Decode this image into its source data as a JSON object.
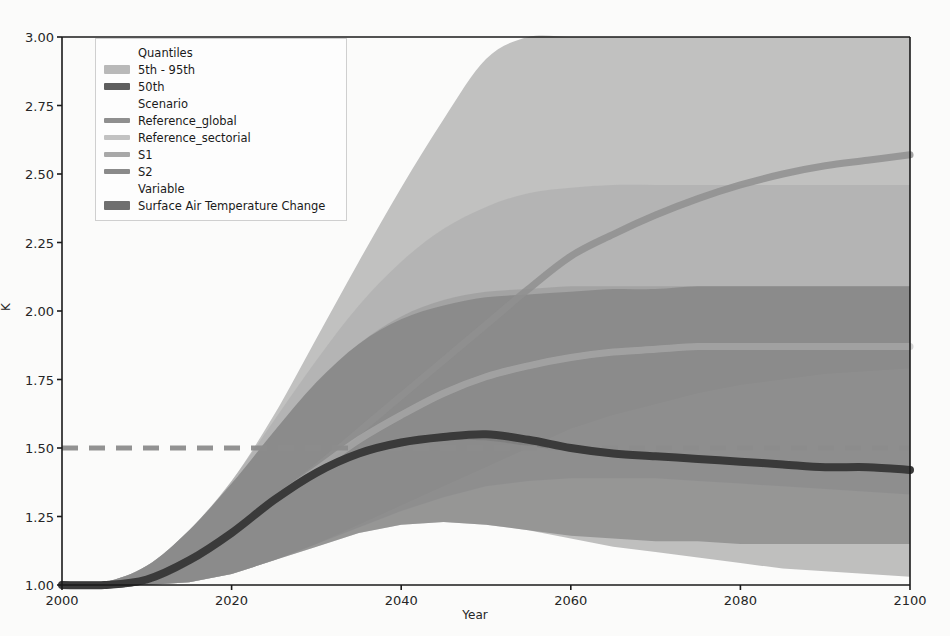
{
  "chart_data": {
    "type": "area",
    "title": "",
    "xlabel": "Year",
    "ylabel": "K",
    "xlim": [
      2000,
      2100
    ],
    "ylim": [
      1.0,
      3.0
    ],
    "xticks": [
      2000,
      2020,
      2040,
      2060,
      2080,
      2100
    ],
    "yticks": [
      "1.00",
      "1.25",
      "1.50",
      "1.75",
      "2.00",
      "2.25",
      "2.50",
      "2.75",
      "3.00"
    ],
    "grid": false,
    "legend_position": "upper left",
    "variable": "Surface Air Temperature Change",
    "annotations": [
      {
        "name": "target-line",
        "type": "hline",
        "y": 1.5,
        "style": "dashed",
        "color": "#8c8c8c"
      }
    ],
    "x": [
      2000,
      2005,
      2010,
      2015,
      2020,
      2025,
      2030,
      2035,
      2040,
      2045,
      2050,
      2055,
      2060,
      2065,
      2070,
      2075,
      2080,
      2085,
      2090,
      2095,
      2100
    ],
    "series": [
      {
        "name": "Reference_global",
        "quantile": "50th",
        "color": "#8f8f8f",
        "values": [
          1.0,
          1.0,
          1.02,
          1.09,
          1.19,
          1.31,
          1.43,
          1.56,
          1.69,
          1.82,
          1.95,
          2.08,
          2.2,
          2.28,
          2.35,
          2.41,
          2.46,
          2.5,
          2.53,
          2.55,
          2.57
        ]
      },
      {
        "name": "Reference_sectorial",
        "quantile": "50th",
        "color": "#b4b4b4",
        "values": [
          1.0,
          1.0,
          1.02,
          1.09,
          1.19,
          1.31,
          1.42,
          1.53,
          1.62,
          1.7,
          1.76,
          1.8,
          1.83,
          1.85,
          1.86,
          1.87,
          1.87,
          1.87,
          1.87,
          1.87,
          1.87
        ]
      },
      {
        "name": "S1",
        "quantile": "50th",
        "color": "#a3a3a3",
        "values": [
          1.0,
          1.0,
          1.02,
          1.09,
          1.19,
          1.31,
          1.41,
          1.48,
          1.52,
          1.54,
          1.54,
          1.52,
          1.5,
          1.48,
          1.47,
          1.46,
          1.45,
          1.44,
          1.43,
          1.43,
          1.42
        ]
      },
      {
        "name": "S2",
        "quantile": "50th",
        "color": "#6e6e6e",
        "values": [
          1.0,
          1.0,
          1.02,
          1.09,
          1.19,
          1.31,
          1.41,
          1.48,
          1.52,
          1.54,
          1.54,
          1.52,
          1.5,
          1.48,
          1.47,
          1.46,
          1.45,
          1.44,
          1.43,
          1.43,
          1.42
        ]
      }
    ],
    "bands": [
      {
        "name": "Reference_global",
        "quantile": "5th - 95th",
        "color": "#9c9c9c",
        "lower": [
          1.0,
          1.0,
          1.0,
          1.01,
          1.04,
          1.09,
          1.15,
          1.22,
          1.29,
          1.36,
          1.43,
          1.5,
          1.57,
          1.62,
          1.66,
          1.7,
          1.73,
          1.75,
          1.77,
          1.78,
          1.79
        ],
        "upper": [
          1.0,
          1.01,
          1.07,
          1.2,
          1.38,
          1.62,
          1.9,
          2.18,
          2.45,
          2.7,
          2.92,
          3.0,
          3.0,
          3.0,
          3.0,
          3.0,
          3.0,
          3.0,
          3.0,
          3.0,
          3.0
        ]
      },
      {
        "name": "Reference_sectorial",
        "quantile": "5th - 95th",
        "color": "#adadad",
        "lower": [
          1.0,
          1.0,
          1.0,
          1.01,
          1.04,
          1.09,
          1.15,
          1.21,
          1.27,
          1.32,
          1.36,
          1.38,
          1.39,
          1.39,
          1.39,
          1.38,
          1.37,
          1.36,
          1.35,
          1.34,
          1.33
        ],
        "upper": [
          1.0,
          1.01,
          1.07,
          1.2,
          1.38,
          1.6,
          1.82,
          2.02,
          2.18,
          2.3,
          2.38,
          2.43,
          2.45,
          2.46,
          2.46,
          2.46,
          2.46,
          2.46,
          2.46,
          2.46,
          2.46
        ]
      },
      {
        "name": "S1",
        "quantile": "5th - 95th",
        "color": "#9a9a9a",
        "lower": [
          1.0,
          1.0,
          1.0,
          1.01,
          1.04,
          1.09,
          1.14,
          1.19,
          1.22,
          1.23,
          1.22,
          1.2,
          1.17,
          1.14,
          1.12,
          1.1,
          1.08,
          1.06,
          1.05,
          1.04,
          1.03
        ],
        "upper": [
          1.0,
          1.01,
          1.07,
          1.2,
          1.37,
          1.56,
          1.74,
          1.88,
          1.98,
          2.04,
          2.07,
          2.08,
          2.09,
          2.09,
          2.09,
          2.09,
          2.09,
          2.09,
          2.09,
          2.09,
          2.09
        ]
      },
      {
        "name": "S2",
        "quantile": "5th - 95th",
        "color": "#7d7d7d",
        "lower": [
          1.0,
          1.0,
          1.0,
          1.01,
          1.04,
          1.09,
          1.14,
          1.19,
          1.22,
          1.23,
          1.22,
          1.2,
          1.18,
          1.17,
          1.16,
          1.16,
          1.15,
          1.15,
          1.15,
          1.15,
          1.15
        ],
        "upper": [
          1.0,
          1.01,
          1.07,
          1.2,
          1.37,
          1.56,
          1.74,
          1.88,
          1.97,
          2.02,
          2.05,
          2.06,
          2.07,
          2.08,
          2.08,
          2.09,
          2.09,
          2.09,
          2.09,
          2.09,
          2.09
        ]
      }
    ],
    "median_line": {
      "name": "median-temperature-line",
      "color": "#3a3a3a",
      "values": [
        1.0,
        1.0,
        1.02,
        1.09,
        1.19,
        1.31,
        1.41,
        1.48,
        1.52,
        1.54,
        1.55,
        1.53,
        1.5,
        1.48,
        1.47,
        1.46,
        1.45,
        1.44,
        1.43,
        1.43,
        1.42
      ]
    }
  },
  "legend": {
    "groups": [
      {
        "title": "Quantiles",
        "entries": [
          {
            "label": "5th - 95th",
            "swatch": "band",
            "color": "#b9b9b9"
          },
          {
            "label": "50th",
            "swatch": "line-thick",
            "color": "#5e5e5e"
          }
        ]
      },
      {
        "title": "Scenario",
        "entries": [
          {
            "label": "Reference_global",
            "swatch": "line",
            "color": "#8f8f8f"
          },
          {
            "label": "Reference_sectorial",
            "swatch": "line",
            "color": "#c2c2c2"
          },
          {
            "label": "S1",
            "swatch": "line",
            "color": "#a8a8a8"
          },
          {
            "label": "S2",
            "swatch": "line",
            "color": "#8a8a8a"
          }
        ]
      },
      {
        "title": "Variable",
        "entries": [
          {
            "label": "Surface Air Temperature Change",
            "swatch": "band",
            "color": "#6f6f6f"
          }
        ]
      }
    ]
  },
  "axes": {
    "ylabel": "K",
    "xlabel": "Year"
  }
}
